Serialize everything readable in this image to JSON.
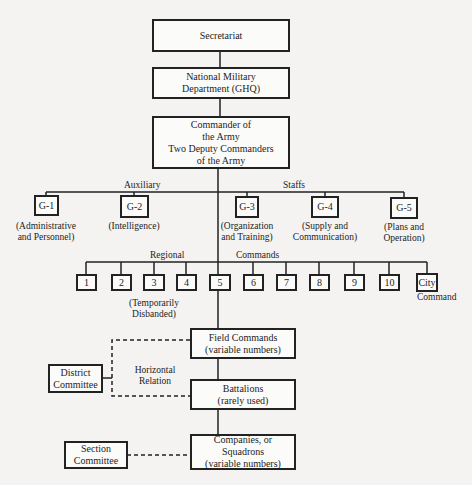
{
  "top": {
    "secretariat": "Secretariat",
    "nmd": "National Military\nDepartment (GHQ)",
    "commander": "Commander of\nthe Army\nTwo Deputy Commanders\nof the Army"
  },
  "group_labels": {
    "auxiliary": "Auxiliary",
    "staffs": "Staffs",
    "regional": "Regional",
    "commands": "Commands"
  },
  "staff_boxes": [
    {
      "code": "G-1",
      "desc": "(Administrative\nand Personnel)"
    },
    {
      "code": "G-2",
      "desc": "(Intelligence)"
    },
    {
      "code": "G-3",
      "desc": "(Organization\nand Training)"
    },
    {
      "code": "G-4",
      "desc": "(Supply and\nCommunication)"
    },
    {
      "code": "G-5",
      "desc": "(Plans and\nOperation)"
    }
  ],
  "regional_commands": [
    "1",
    "2",
    "3",
    "4",
    "5",
    "6",
    "7",
    "8",
    "9",
    "10",
    "City"
  ],
  "regional_notes": {
    "temporarily_disbanded": "(Temporarily\nDisbanded)",
    "city_suffix": "Command"
  },
  "lower": {
    "field_commands": "Field Commands\n(variable numbers)",
    "battalions": "Battalions\n(rarely used)",
    "companies": "Companies, or\nSquadrons\n(variable numbers)",
    "district_committee": "District\nCommittee",
    "section_committee": "Section\nCommittee",
    "horizontal_relation": "Horizontal\nRelation"
  }
}
